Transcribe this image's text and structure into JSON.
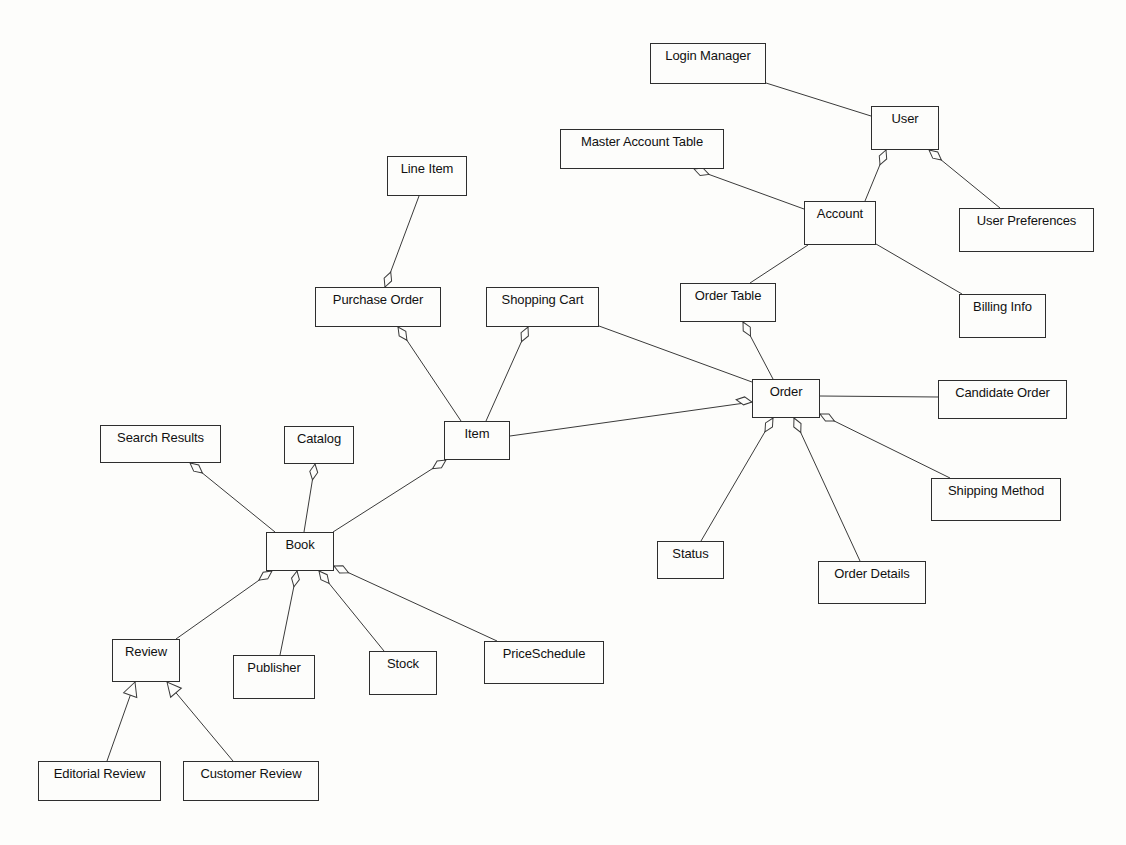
{
  "diagram": {
    "type": "UML class diagram",
    "classes": [
      {
        "id": "login_manager",
        "label": "Login Manager",
        "x": 650,
        "y": 43,
        "w": 116,
        "h": 41
      },
      {
        "id": "user",
        "label": "User",
        "x": 871,
        "y": 106,
        "w": 68,
        "h": 44
      },
      {
        "id": "master_account_table",
        "label": "Master Account Table",
        "x": 560,
        "y": 129,
        "w": 164,
        "h": 40
      },
      {
        "id": "account",
        "label": "Account",
        "x": 804,
        "y": 201,
        "w": 72,
        "h": 44
      },
      {
        "id": "user_preferences",
        "label": "User Preferences",
        "x": 959,
        "y": 208,
        "w": 135,
        "h": 44
      },
      {
        "id": "line_item",
        "label": "Line Item",
        "x": 387,
        "y": 156,
        "w": 80,
        "h": 40
      },
      {
        "id": "purchase_order",
        "label": "Purchase Order",
        "x": 315,
        "y": 287,
        "w": 126,
        "h": 40
      },
      {
        "id": "shopping_cart",
        "label": "Shopping Cart",
        "x": 486,
        "y": 287,
        "w": 113,
        "h": 40
      },
      {
        "id": "order_table",
        "label": "Order Table",
        "x": 680,
        "y": 283,
        "w": 96,
        "h": 39
      },
      {
        "id": "billing_info",
        "label": "Billing Info",
        "x": 959,
        "y": 294,
        "w": 87,
        "h": 44
      },
      {
        "id": "order",
        "label": "Order",
        "x": 752,
        "y": 379,
        "w": 68,
        "h": 39
      },
      {
        "id": "candidate_order",
        "label": "Candidate Order",
        "x": 938,
        "y": 380,
        "w": 129,
        "h": 39
      },
      {
        "id": "item",
        "label": "Item",
        "x": 444,
        "y": 421,
        "w": 66,
        "h": 39
      },
      {
        "id": "search_results",
        "label": "Search Results",
        "x": 100,
        "y": 425,
        "w": 121,
        "h": 38
      },
      {
        "id": "catalog",
        "label": "Catalog",
        "x": 284,
        "y": 426,
        "w": 70,
        "h": 38
      },
      {
        "id": "book",
        "label": "Book",
        "x": 266,
        "y": 532,
        "w": 68,
        "h": 39
      },
      {
        "id": "shipping_method",
        "label": "Shipping Method",
        "x": 931,
        "y": 478,
        "w": 130,
        "h": 43
      },
      {
        "id": "status",
        "label": "Status",
        "x": 657,
        "y": 541,
        "w": 67,
        "h": 38
      },
      {
        "id": "order_details",
        "label": "Order Details",
        "x": 818,
        "y": 561,
        "w": 108,
        "h": 43
      },
      {
        "id": "review",
        "label": "Review",
        "x": 112,
        "y": 639,
        "w": 68,
        "h": 43
      },
      {
        "id": "publisher",
        "label": "Publisher",
        "x": 233,
        "y": 655,
        "w": 82,
        "h": 44
      },
      {
        "id": "stock",
        "label": "Stock",
        "x": 369,
        "y": 651,
        "w": 68,
        "h": 44
      },
      {
        "id": "price_schedule",
        "label": "PriceSchedule",
        "x": 484,
        "y": 641,
        "w": 120,
        "h": 43
      },
      {
        "id": "editorial_review",
        "label": "Editorial Review",
        "x": 38,
        "y": 761,
        "w": 123,
        "h": 40
      },
      {
        "id": "customer_review",
        "label": "Customer Review",
        "x": 183,
        "y": 761,
        "w": 136,
        "h": 40
      }
    ],
    "relationships": [
      {
        "from": "login_manager",
        "to": "user",
        "kind": "association",
        "x1": 766,
        "y1": 83,
        "x2": 871,
        "y2": 116
      },
      {
        "from": "user",
        "to": "account",
        "kind": "aggregation",
        "diamond_at": "user",
        "x1": 886,
        "y1": 150,
        "x2": 865,
        "y2": 201,
        "dx": 886,
        "dy": 150,
        "angle": 112
      },
      {
        "from": "user",
        "to": "user_preferences",
        "kind": "aggregation",
        "diamond_at": "user",
        "x1": 929,
        "y1": 150,
        "x2": 1000,
        "y2": 208,
        "dx": 929,
        "dy": 150,
        "angle": 39
      },
      {
        "from": "master_account_table",
        "to": "account",
        "kind": "aggregation",
        "diamond_at": "master_account_table",
        "x1": 694,
        "y1": 169,
        "x2": 804,
        "y2": 209,
        "dx": 694,
        "dy": 169,
        "angle": 20
      },
      {
        "from": "account",
        "to": "order_table",
        "kind": "association",
        "x1": 808,
        "y1": 245,
        "x2": 750,
        "y2": 283
      },
      {
        "from": "account",
        "to": "billing_info",
        "kind": "association",
        "x1": 876,
        "y1": 244,
        "x2": 962,
        "y2": 294
      },
      {
        "from": "line_item",
        "to": "purchase_order",
        "kind": "aggregation",
        "diamond_at": "purchase_order",
        "x1": 419,
        "y1": 196,
        "x2": 385,
        "y2": 287,
        "dx": 385,
        "dy": 287,
        "angle": -69
      },
      {
        "from": "purchase_order",
        "to": "item",
        "kind": "aggregation",
        "diamond_at": "purchase_order",
        "x1": 398,
        "y1": 327,
        "x2": 461,
        "y2": 421,
        "dx": 398,
        "dy": 327,
        "angle": 56
      },
      {
        "from": "shopping_cart",
        "to": "item",
        "kind": "aggregation",
        "diamond_at": "shopping_cart",
        "x1": 528,
        "y1": 327,
        "x2": 486,
        "y2": 421,
        "dx": 528,
        "dy": 327,
        "angle": 114
      },
      {
        "from": "shopping_cart",
        "to": "order",
        "kind": "association",
        "x1": 599,
        "y1": 326,
        "x2": 752,
        "y2": 382
      },
      {
        "from": "order_table",
        "to": "order",
        "kind": "aggregation",
        "diamond_at": "order_table",
        "x1": 743,
        "y1": 322,
        "x2": 773,
        "y2": 379,
        "dx": 743,
        "dy": 322,
        "angle": 62
      },
      {
        "from": "item",
        "to": "order",
        "kind": "aggregation",
        "diamond_at": "order",
        "x1": 510,
        "y1": 436,
        "x2": 752,
        "y2": 402,
        "dx": 752,
        "dy": 402,
        "angle": -172
      },
      {
        "from": "order",
        "to": "candidate_order",
        "kind": "association",
        "x1": 820,
        "y1": 396,
        "x2": 938,
        "y2": 397
      },
      {
        "from": "order",
        "to": "status",
        "kind": "aggregation",
        "diamond_at": "order",
        "x1": 773,
        "y1": 418,
        "x2": 701,
        "y2": 541,
        "dx": 773,
        "dy": 418,
        "angle": 120
      },
      {
        "from": "order",
        "to": "order_details",
        "kind": "aggregation",
        "diamond_at": "order",
        "x1": 794,
        "y1": 418,
        "x2": 860,
        "y2": 561,
        "dx": 794,
        "dy": 418,
        "angle": 65
      },
      {
        "from": "order",
        "to": "shipping_method",
        "kind": "aggregation",
        "diamond_at": "order",
        "x1": 820,
        "y1": 414,
        "x2": 950,
        "y2": 478,
        "dx": 820,
        "dy": 414,
        "angle": 26
      },
      {
        "from": "search_results",
        "to": "book",
        "kind": "aggregation",
        "diamond_at": "search_results",
        "x1": 190,
        "y1": 463,
        "x2": 275,
        "y2": 532,
        "dx": 190,
        "dy": 463,
        "angle": 39
      },
      {
        "from": "catalog",
        "to": "book",
        "kind": "aggregation",
        "diamond_at": "catalog",
        "x1": 315,
        "y1": 464,
        "x2": 304,
        "y2": 532,
        "dx": 315,
        "dy": 464,
        "angle": 99
      },
      {
        "from": "item",
        "to": "book",
        "kind": "aggregation",
        "diamond_at": "item",
        "x1": 446,
        "y1": 460,
        "x2": 333,
        "y2": 532,
        "dx": 446,
        "dy": 460,
        "angle": 147
      },
      {
        "from": "book",
        "to": "review",
        "kind": "aggregation",
        "diamond_at": "book",
        "x1": 272,
        "y1": 571,
        "x2": 176,
        "y2": 639,
        "dx": 272,
        "dy": 571,
        "angle": 145
      },
      {
        "from": "book",
        "to": "publisher",
        "kind": "aggregation",
        "diamond_at": "book",
        "x1": 297,
        "y1": 571,
        "x2": 280,
        "y2": 655,
        "dx": 297,
        "dy": 571,
        "angle": 101
      },
      {
        "from": "book",
        "to": "stock",
        "kind": "aggregation",
        "diamond_at": "book",
        "x1": 319,
        "y1": 571,
        "x2": 384,
        "y2": 651,
        "dx": 319,
        "dy": 571,
        "angle": 51
      },
      {
        "from": "book",
        "to": "price_schedule",
        "kind": "aggregation",
        "diamond_at": "book",
        "x1": 334,
        "y1": 566,
        "x2": 497,
        "y2": 641,
        "dx": 334,
        "dy": 566,
        "angle": 25
      },
      {
        "from": "editorial_review",
        "to": "review",
        "kind": "generalization",
        "x1": 107,
        "y1": 761,
        "x2": 135,
        "y2": 682,
        "angle": -70
      },
      {
        "from": "customer_review",
        "to": "review",
        "kind": "generalization",
        "x1": 233,
        "y1": 761,
        "x2": 167,
        "y2": 682,
        "angle": -130
      }
    ]
  }
}
